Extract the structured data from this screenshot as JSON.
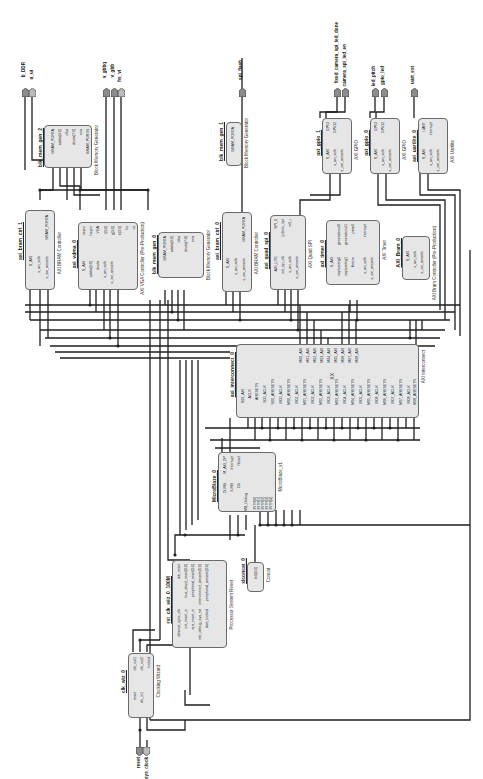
{
  "diagram": {
    "orientation": "rotated-90-ccw",
    "colors": {
      "block_fill": "#e6e6e6",
      "block_border": "#6a6a6a",
      "wire": "#1e1e1e",
      "port_fill": "#8c8c8c"
    },
    "external_ports": [
      {
        "id": "p_dram_wr",
        "label": "b_DDR"
      },
      {
        "id": "p_ui",
        "label": "u_ui"
      },
      {
        "id": "p_vga_r",
        "label": "v_gbbq"
      },
      {
        "id": "p_vga_g",
        "label": "v_gbb"
      },
      {
        "id": "p_vga_hs",
        "label": "hs_vi"
      },
      {
        "id": "p_spi",
        "label": "spi_flash"
      },
      {
        "id": "p_gpio1a",
        "label": "fixed_camera_spi_led_done"
      },
      {
        "id": "p_gpio1b",
        "label": "camera_spi_led_en"
      },
      {
        "id": "p_gpio2a",
        "label": "led_pitch"
      },
      {
        "id": "p_gpio2b",
        "label": "gpio_led"
      },
      {
        "id": "p_uart",
        "label": "uart_ext"
      },
      {
        "id": "p_reset",
        "label": "reset"
      },
      {
        "id": "p_sysclk",
        "label": "sys_clock"
      }
    ],
    "blocks": [
      {
        "id": "blk_mem_gen_2",
        "instance": "blk_mem_gen_2",
        "ip": "Block Memory Generator",
        "pins": [
          "BRAM_PORTA",
          "addra[9:0]",
          "clka",
          "douta[7:0]",
          "ena",
          "BRAM_PORTB"
        ]
      },
      {
        "id": "axi_bram_ctrl_1",
        "instance": "axi_bram_ctrl_1",
        "ip": "AXI BRAM Controller",
        "pins": [
          "S_AXI",
          "s_axi_aclk",
          "s_axi_aresetn",
          "BRAM_PORTA"
        ]
      },
      {
        "id": "axi_vdma_0",
        "instance": "axi_vdma_0",
        "ip": "AXI VGA Controller (Pre-Production)",
        "pins": [
          "S_AXI",
          "addra[9:0]",
          "douta",
          "s_axi_aclk",
          "s_axi_aresetn",
          "vsync",
          "hsync",
          "VGA",
          "r[3:0]",
          "g[3:0]",
          "b[3:0]",
          "hs",
          "vs"
        ]
      },
      {
        "id": "blk_mem_gen_0",
        "instance": "blk_mem_gen_0",
        "ip": "Block Memory Generator",
        "pins": [
          "BRAM_PORTA",
          "addra[9:0]",
          "clka",
          "douta[7:0]",
          "ena"
        ]
      },
      {
        "id": "blk_mem_gen_1",
        "instance": "blk_mem_gen_1",
        "ip": "Block Memory Generator",
        "pins": [
          "BRAM_PORTA"
        ]
      },
      {
        "id": "axi_bram_ctrl_0",
        "instance": "axi_bram_ctrl_0",
        "ip": "AXI BRAM Controller",
        "pins": [
          "S_AXI",
          "s_axi_aclk",
          "s_axi_aresetn",
          "BRAM_PORTA"
        ]
      },
      {
        "id": "axi_quad_spi_0",
        "instance": "axi_quad_spi_0",
        "ip": "AXI Quad SPI",
        "pins": [
          "AXI_LITE",
          "ext_spi_clk",
          "s_axi_aclk",
          "s_axi_aresetn",
          "SPI_0",
          "ip2intc_irpt",
          "io0_i"
        ]
      },
      {
        "id": "axi_timer_0",
        "instance": "axi_timer_0",
        "ip": "AXI Timer",
        "pins": [
          "S_AXI",
          "capturetrig0",
          "capturetrig1",
          "freeze",
          "s_axi_aclk",
          "s_axi_aresetn",
          "generateout0",
          "generateout1",
          "pwm0",
          "interrupt"
        ]
      },
      {
        "id": "axi_gpio_1",
        "instance": "axi_gpio_1",
        "ip": "AXI GPIO",
        "pins": [
          "S_AXI",
          "s_axi_aclk",
          "s_axi_aresetn",
          "GPIO",
          "GPIO2"
        ]
      },
      {
        "id": "axi_gpio_0",
        "instance": "axi_gpio_0",
        "ip": "AXI GPIO",
        "pins": [
          "S_AXI",
          "s_axi_aclk",
          "s_axi_aresetn",
          "GPIO",
          "GPIO2"
        ]
      },
      {
        "id": "axi_uartlite_0",
        "instance": "axi_uartlite_0",
        "ip": "AXI Uartlite",
        "pins": [
          "S_AXI",
          "s_axi_aclk",
          "s_axi_aresetn",
          "UART",
          "interrupt"
        ]
      },
      {
        "id": "axi_bram_0",
        "instance": "AXI_Bram_0",
        "ip": "AXI Bram Controller (Pre-Production)",
        "pins": [
          "S_AXI",
          "s_axi_aclk",
          "s_axi_aresetn"
        ]
      },
      {
        "id": "axi_interconnect_0",
        "instance": "axi_interconnect_0",
        "ip": "AXI Interconnect",
        "center": "XX",
        "top_pins": [
          "M00_AXI",
          "M01_AXI",
          "M02_AXI",
          "M03_AXI",
          "M04_AXI",
          "M05_AXI",
          "M06_AXI",
          "M07_AXI",
          "M08_AXI"
        ],
        "bottom_pins": [
          "S00_AXI",
          "ACLK",
          "ARESETN",
          "S00_ACLK",
          "S00_ARESETN",
          "M00_ACLK",
          "M00_ARESETN",
          "M01_ACLK",
          "M01_ARESETN",
          "M02_ACLK",
          "M02_ARESETN",
          "M03_ACLK",
          "M03_ARESETN",
          "M04_ACLK",
          "M04_ARESETN",
          "M05_ACLK",
          "M05_ARESETN",
          "M06_ACLK",
          "M06_ARESETN",
          "M07_ACLK",
          "M07_ARESETN",
          "M08_ACLK",
          "M08_ARESETN"
        ]
      },
      {
        "id": "microblaze_0",
        "instance": "MicroBlaze_0",
        "ip": "MicroBlaze_v1",
        "pins": [
          "DLMB",
          "ILMB",
          "M_AXI_DP",
          "Interrupt",
          "Clk",
          "Reset",
          "MB_Debug",
          "INTR[0]",
          "INTR[1]",
          "INTR[2]",
          "INTR[3]",
          "INTR[4]",
          "INTR[5]"
        ]
      },
      {
        "id": "xlconcat_0",
        "instance": "xlconcat_0",
        "ip": "Concat",
        "pins": [
          "In0[0:0]",
          "dout[5:0]"
        ]
      },
      {
        "id": "rst_clk_wiz_0",
        "instance": "rst_clk_wiz_0_100M",
        "ip": "Processor System Reset",
        "pins": [
          "slowest_sync_clk",
          "ext_reset_in",
          "aux_reset_in",
          "mb_debug_sys_rst",
          "dcm_locked",
          "mb_reset",
          "bus_struct_reset[0:0]",
          "peripheral_reset[0:0]",
          "interconnect_aresetn[0:0]",
          "peripheral_aresetn[0:0]"
        ]
      },
      {
        "id": "clk_wiz_0",
        "instance": "clk_wiz_0",
        "ip": "Clocking Wizard",
        "pins": [
          "reset",
          "clk_in1",
          "clk_out1",
          "clk_out2",
          "locked"
        ]
      }
    ]
  }
}
